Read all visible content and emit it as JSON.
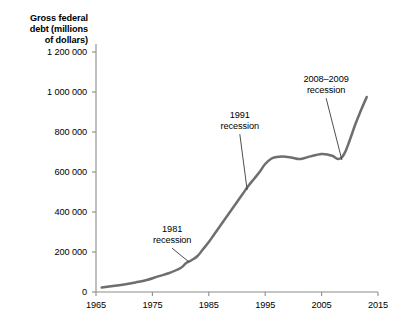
{
  "chart_data": {
    "type": "line",
    "title_lines": [
      "Gross federal",
      "debt (millions",
      "of dollars)"
    ],
    "xlabel": "",
    "ylabel": "Gross federal debt (millions of dollars)",
    "xlim": [
      1965,
      2015
    ],
    "ylim": [
      0,
      1200000
    ],
    "xticks": [
      1965,
      1975,
      1985,
      1995,
      2005,
      2015
    ],
    "xtick_labels": [
      "1965",
      "1975",
      "1985",
      "1995",
      "2005",
      "2015"
    ],
    "yticks": [
      0,
      200000,
      400000,
      600000,
      800000,
      1000000,
      1200000
    ],
    "ytick_labels": [
      "0",
      "200 000",
      "400 000",
      "600 000",
      "800 000",
      "1 000 000",
      "1 200 000"
    ],
    "grid": false,
    "legend": false,
    "line_color": "#6e6e6e",
    "axis_color": "#8c8c8c",
    "series": [
      {
        "name": "Gross federal debt",
        "x": [
          1966,
          1968,
          1970,
          1972,
          1974,
          1976,
          1978,
          1980,
          1981,
          1982,
          1983,
          1984,
          1985,
          1986,
          1987,
          1988,
          1989,
          1990,
          1991,
          1992,
          1993,
          1994,
          1995,
          1996,
          1997,
          1998,
          1999,
          2000,
          2001,
          2002,
          2003,
          2004,
          2005,
          2006,
          2007,
          2008,
          2009,
          2010,
          2011,
          2012,
          2013
        ],
        "y": [
          22000,
          30000,
          38000,
          48000,
          60000,
          78000,
          95000,
          120000,
          145000,
          160000,
          180000,
          215000,
          250000,
          290000,
          330000,
          370000,
          410000,
          450000,
          490000,
          530000,
          565000,
          600000,
          640000,
          665000,
          675000,
          678000,
          675000,
          670000,
          665000,
          670000,
          678000,
          685000,
          690000,
          688000,
          680000,
          665000,
          690000,
          760000,
          840000,
          910000,
          975000
        ]
      }
    ],
    "annotations": [
      {
        "id": "recession-1981",
        "lines": [
          "1981",
          "recession"
        ],
        "text": "1981 recession",
        "label_x": 1978.5,
        "label_y": 300000,
        "point_x": 1981.5,
        "point_y": 150000
      },
      {
        "id": "recession-1991",
        "lines": [
          "1991",
          "recession"
        ],
        "text": "1991 recession",
        "label_x": 1990.5,
        "label_y": 870000,
        "point_x": 1991.8,
        "point_y": 510000
      },
      {
        "id": "recession-2008-2009",
        "lines": [
          "2008–2009",
          "recession"
        ],
        "text": "2008–2009 recession",
        "label_x": 2005.8,
        "label_y": 1050000,
        "point_x": 2008.6,
        "point_y": 660000
      }
    ]
  }
}
